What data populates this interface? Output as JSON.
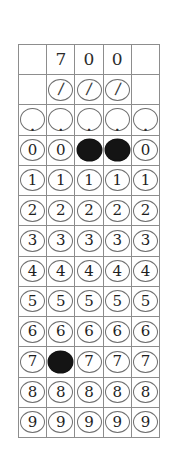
{
  "sheet": {
    "title": "Gridded Response Answer Grid",
    "columns": 5,
    "rows": 13,
    "marked_value": "700",
    "colors": {
      "grid_line": "#8d8d8d",
      "bubble_outline": "#6f6f6f",
      "bubble_fill": "#141414",
      "text": "#1e1e1e",
      "background": "#ffffff"
    }
  },
  "answer_row": {
    "name": "handwritten-answer-row",
    "digits": [
      "",
      "7",
      "0",
      "0",
      ""
    ]
  },
  "slash_row": {
    "name": "fraction-bar-row",
    "glyph": "/",
    "present": [
      false,
      true,
      true,
      true,
      false
    ],
    "filled": [
      false,
      false,
      false,
      false,
      false
    ]
  },
  "decimal_row": {
    "name": "decimal-point-row",
    "glyph": ".",
    "present": [
      true,
      true,
      true,
      true,
      true
    ],
    "filled": [
      false,
      false,
      false,
      false,
      false
    ]
  },
  "digit_rows": [
    {
      "label": "0",
      "filled": [
        false,
        false,
        true,
        true,
        false
      ]
    },
    {
      "label": "1",
      "filled": [
        false,
        false,
        false,
        false,
        false
      ]
    },
    {
      "label": "2",
      "filled": [
        false,
        false,
        false,
        false,
        false
      ]
    },
    {
      "label": "3",
      "filled": [
        false,
        false,
        false,
        false,
        false
      ]
    },
    {
      "label": "4",
      "filled": [
        false,
        false,
        false,
        false,
        false
      ]
    },
    {
      "label": "5",
      "filled": [
        false,
        false,
        false,
        false,
        false
      ]
    },
    {
      "label": "6",
      "filled": [
        false,
        false,
        false,
        false,
        false
      ]
    },
    {
      "label": "7",
      "filled": [
        false,
        true,
        false,
        false,
        false
      ]
    },
    {
      "label": "8",
      "filled": [
        false,
        false,
        false,
        false,
        false
      ]
    },
    {
      "label": "9",
      "filled": [
        false,
        false,
        false,
        false,
        false
      ]
    }
  ]
}
